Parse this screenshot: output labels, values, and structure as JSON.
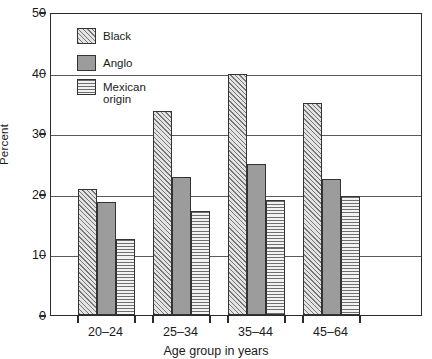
{
  "chart_data": {
    "type": "bar",
    "title": "",
    "subtitle": "",
    "xlabel": "Age group in years",
    "ylabel": "Percent",
    "categories": [
      "20–24",
      "25–34",
      "35–44",
      "45–64"
    ],
    "series": [
      {
        "name": "Black",
        "pattern": "diagonal-hatch",
        "values": [
          20.8,
          33.6,
          39.7,
          35.0
        ]
      },
      {
        "name": "Anglo",
        "pattern": "solid-gray",
        "values": [
          18.6,
          22.8,
          25.0,
          22.5
        ]
      },
      {
        "name": "Mexican\norigin",
        "pattern": "horizontal-lines",
        "values": [
          12.5,
          17.2,
          18.9,
          19.6
        ]
      }
    ],
    "ylim": [
      0,
      50
    ],
    "ytick_values": [
      0,
      10,
      20,
      30,
      40,
      50
    ],
    "ytick_labels": [
      "0",
      "10",
      "20",
      "30",
      "40",
      "50"
    ],
    "grid": true,
    "grid_axis": "y",
    "legend_position": "upper-left-inside",
    "colors": {
      "frame": "#2b2b2b",
      "gridline": "#5a5a5a",
      "bar_outline": "#333333",
      "anglo_fill": "#9c9c9c",
      "hatch_fill": "#d2d2d2",
      "hlines_fill": "#ededed",
      "background": "#ffffff",
      "text": "#1a1a1a"
    }
  },
  "legend": {
    "entries": [
      {
        "label": "Black"
      },
      {
        "label": "Anglo"
      },
      {
        "label": "Mexican\norigin"
      }
    ]
  },
  "axes": {
    "y_title": "Percent",
    "x_title": "Age group in years"
  }
}
